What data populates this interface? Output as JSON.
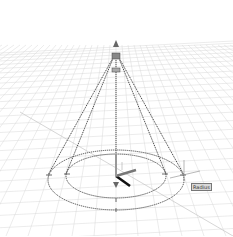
{
  "viewport": {
    "background": "#ffffff",
    "grid_color": "#d9d9d9",
    "wire_color": "#555555"
  },
  "tooltip": {
    "label": "Radius"
  },
  "icons": {
    "top_grip": "triangle-grip",
    "bottom_grip": "triangle-grip",
    "ucs": "ucs-axes",
    "cursor": "crosshair"
  }
}
